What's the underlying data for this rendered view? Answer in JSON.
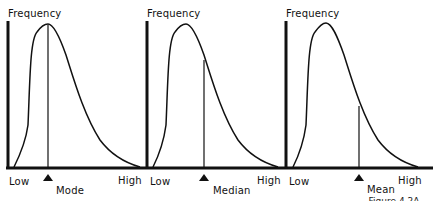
{
  "figure": {
    "panels": [
      {
        "y_label": "Frequency",
        "x_low": "Low",
        "x_high": "High",
        "marker_label": "Mode",
        "measure": "mode"
      },
      {
        "y_label": "Frequency",
        "x_low": "Low",
        "x_high": "High",
        "marker_label": "Median",
        "measure": "median"
      },
      {
        "y_label": "Frequency",
        "x_low": "Low",
        "x_high": "High",
        "marker_label": "Mean",
        "measure": "mean"
      }
    ],
    "caption_partial": "...Figure 4.2A",
    "colors": {
      "ink": "#111111",
      "background": "#ffffff"
    }
  }
}
